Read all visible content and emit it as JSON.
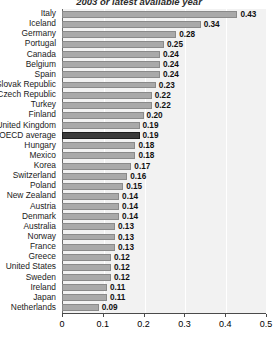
{
  "chart_data": {
    "type": "bar",
    "orientation": "horizontal",
    "title": "2003 or latest available year",
    "xlabel": "",
    "ylabel": "",
    "xlim": [
      0,
      0.5
    ],
    "xticks": [
      "0",
      "0.1",
      "0.2",
      "0.3",
      "0.4",
      "0.5"
    ],
    "xtick_values": [
      0,
      0.1,
      0.2,
      0.3,
      0.4,
      0.5
    ],
    "grid": true,
    "legend": "none",
    "highlight_category": "OECD average",
    "categories": [
      "Italy",
      "Iceland",
      "Germany",
      "Portugal",
      "Canada",
      "Belgium",
      "Spain",
      "Slovak Republic",
      "Czech Republic",
      "Turkey",
      "Finland",
      "United Kingdom",
      "OECD average",
      "Hungary",
      "Mexico",
      "Korea",
      "Switzerland",
      "Poland",
      "New Zealand",
      "Austria",
      "Denmark",
      "Australia",
      "Norway",
      "France",
      "Greece",
      "United States",
      "Sweden",
      "Ireland",
      "Japan",
      "Netherlands"
    ],
    "values": [
      0.43,
      0.34,
      0.28,
      0.25,
      0.24,
      0.24,
      0.24,
      0.23,
      0.22,
      0.22,
      0.2,
      0.19,
      0.19,
      0.18,
      0.18,
      0.17,
      0.16,
      0.15,
      0.14,
      0.14,
      0.14,
      0.13,
      0.13,
      0.13,
      0.12,
      0.12,
      0.12,
      0.11,
      0.11,
      0.09
    ],
    "value_labels": [
      "0.43",
      "0.34",
      "0.28",
      "0.25",
      "0.24",
      "0.24",
      "0.24",
      "0.23",
      "0.22",
      "0.22",
      "0.20",
      "0.19",
      "0.19",
      "0.18",
      "0.18",
      "0.17",
      "0.16",
      "0.15",
      "0.14",
      "0.14",
      "0.14",
      "0.13",
      "0.13",
      "0.13",
      "0.12",
      "0.12",
      "0.12",
      "0.11",
      "0.11",
      "0.09"
    ],
    "colors": {
      "bar": "#a9a9a9",
      "bar_border": "#8a8a8a",
      "highlight_bar": "#3a3a3a",
      "plot_background": "#f2f2f2",
      "gridline": "#ffffff",
      "axis": "#4a4a4a",
      "text": "#111111"
    }
  }
}
